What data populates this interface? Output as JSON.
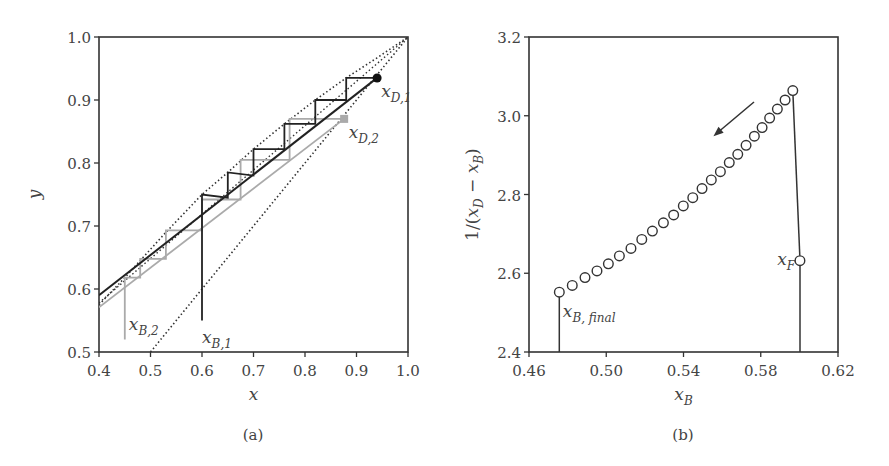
{
  "chart_data": [
    {
      "panel": "(a)",
      "type": "line",
      "xlabel": "x",
      "ylabel": "y",
      "xlim": [
        0.4,
        1.0
      ],
      "ylim": [
        0.5,
        1.0
      ],
      "xticks": [
        "0.4",
        "0.5",
        "0.6",
        "0.7",
        "0.8",
        "0.9",
        "1.0"
      ],
      "yticks": [
        "0.5",
        "0.6",
        "0.7",
        "0.8",
        "0.9",
        "1.0"
      ],
      "grid": false,
      "series": [
        {
          "name": "equilibrium curve",
          "style": "dotted",
          "color": "#333333",
          "x": [
            0.4,
            0.45,
            0.48,
            0.53,
            0.6,
            0.65,
            0.7,
            0.76,
            0.82,
            0.88,
            0.94,
            1.0
          ],
          "y": [
            0.575,
            0.618,
            0.645,
            0.69,
            0.75,
            0.785,
            0.822,
            0.862,
            0.9,
            0.935,
            0.967,
            1.0
          ]
        },
        {
          "name": "diagonal y=x",
          "style": "dotted",
          "color": "#333333",
          "x": [
            0.5,
            1.0
          ],
          "y": [
            0.5,
            1.0
          ]
        },
        {
          "name": "operating line 1",
          "style": "solid",
          "color": "#222222",
          "x": [
            0.4,
            0.94
          ],
          "y": [
            0.59,
            0.935
          ]
        },
        {
          "name": "operating line 2",
          "style": "solid",
          "color": "#aaaaaa",
          "x": [
            0.4,
            0.876
          ],
          "y": [
            0.571,
            0.87
          ]
        },
        {
          "name": "stages 1",
          "style": "solid",
          "color": "#222222",
          "x": [
            0.94,
            0.88,
            0.88,
            0.82,
            0.82,
            0.76,
            0.76,
            0.7,
            0.7,
            0.65,
            0.65,
            0.6,
            0.6
          ],
          "y": [
            0.935,
            0.935,
            0.9,
            0.9,
            0.862,
            0.862,
            0.822,
            0.822,
            0.78,
            0.785,
            0.745,
            0.75,
            0.55
          ]
        },
        {
          "name": "stages 2",
          "style": "solid",
          "color": "#aaaaaa",
          "x": [
            0.876,
            0.77,
            0.77,
            0.675,
            0.675,
            0.6,
            0.6,
            0.53,
            0.53,
            0.48,
            0.48,
            0.45,
            0.45
          ],
          "y": [
            0.87,
            0.87,
            0.805,
            0.805,
            0.742,
            0.742,
            0.693,
            0.693,
            0.648,
            0.648,
            0.618,
            0.618,
            0.52
          ]
        }
      ],
      "markers": [
        {
          "label": "x_D,1",
          "x": 0.94,
          "y": 0.935,
          "shape": "circle",
          "color": "#111111"
        },
        {
          "label": "x_D,2",
          "x": 0.876,
          "y": 0.87,
          "shape": "square",
          "color": "#aaaaaa"
        }
      ],
      "annotations": [
        {
          "text": "x",
          "sub": "D,1",
          "x": 0.948,
          "y": 0.905
        },
        {
          "text": "x",
          "sub": "D,2",
          "x": 0.885,
          "y": 0.84
        },
        {
          "text": "x",
          "sub": "B,2",
          "x": 0.458,
          "y": 0.535
        },
        {
          "text": "x",
          "sub": "B,1",
          "x": 0.6,
          "y": 0.515
        }
      ]
    },
    {
      "panel": "(b)",
      "type": "scatter",
      "xlabel": "x_B",
      "ylabel": "1/(x_D − x_B)",
      "xlim": [
        0.46,
        0.62
      ],
      "ylim": [
        2.4,
        3.2
      ],
      "xticks": [
        "0.46",
        "0.50",
        "0.54",
        "0.58",
        "0.62"
      ],
      "yticks": [
        "2.4",
        "2.6",
        "2.8",
        "3.0",
        "3.2"
      ],
      "grid": false,
      "series": [
        {
          "name": "1/(xD - xB)",
          "marker": "open circle",
          "x": [
            0.4757,
            0.4824,
            0.489,
            0.4952,
            0.5011,
            0.5068,
            0.5128,
            0.5184,
            0.5239,
            0.5296,
            0.5349,
            0.5399,
            0.5448,
            0.5496,
            0.5544,
            0.5591,
            0.5637,
            0.5681,
            0.5724,
            0.5767,
            0.5807,
            0.5846,
            0.5886,
            0.5926,
            0.5966
          ],
          "y": [
            2.552,
            2.569,
            2.589,
            2.606,
            2.624,
            2.644,
            2.663,
            2.686,
            2.707,
            2.728,
            2.748,
            2.771,
            2.792,
            2.815,
            2.837,
            2.858,
            2.881,
            2.902,
            2.925,
            2.948,
            2.97,
            2.994,
            3.017,
            3.04,
            3.064
          ]
        }
      ],
      "markers": [
        {
          "label": "x_F",
          "x": 0.6003,
          "y": 2.632,
          "shape": "open circle"
        }
      ],
      "lines": [
        {
          "name": "x_B,final drop",
          "x": [
            0.4757,
            0.4757
          ],
          "y": [
            2.4,
            2.552
          ]
        },
        {
          "name": "x_F drop",
          "x": [
            0.6003,
            0.6003
          ],
          "y": [
            2.4,
            2.632
          ]
        },
        {
          "name": "connect",
          "x": [
            0.5966,
            0.6003
          ],
          "y": [
            3.064,
            2.632
          ]
        }
      ],
      "arrow": {
        "from": [
          0.5765,
          3.035
        ],
        "to": [
          0.5555,
          2.948
        ],
        "meaning": "direction of decreasing x_B"
      },
      "annotations": [
        {
          "text": "x",
          "sub": "B, final",
          "x": 0.4775,
          "y": 2.49
        },
        {
          "text": "x",
          "sub": "F",
          "x": 0.5885,
          "y": 2.62
        }
      ]
    }
  ],
  "captions": {
    "a": "(a)",
    "b": "(b)"
  },
  "colors": {
    "axis": "#333333",
    "dark": "#222222",
    "light": "#aaaaaa"
  }
}
